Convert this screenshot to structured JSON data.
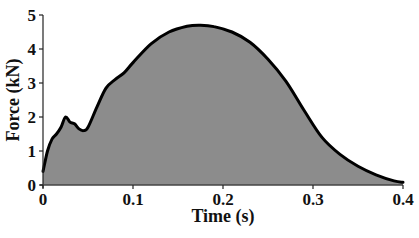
{
  "chart_data": {
    "type": "area",
    "title": "",
    "xlabel": "Time (s)",
    "ylabel": "Force (kN)",
    "xlim": [
      0,
      0.4
    ],
    "ylim": [
      0,
      5
    ],
    "x_ticks": [
      0,
      0.1,
      0.2,
      0.3,
      0.4
    ],
    "x_tick_labels": [
      "0",
      "0.1",
      "0.2",
      "0.3",
      "0.4"
    ],
    "y_ticks": [
      0,
      1,
      2,
      3,
      4,
      5
    ],
    "y_tick_labels": [
      "0",
      "1",
      "2",
      "3",
      "4",
      "5"
    ],
    "grid": false,
    "legend": null,
    "fill_color": "#8c8c8c",
    "line_color": "#000000",
    "series": [
      {
        "name": "Force",
        "x": [
          0,
          0.005,
          0.01,
          0.015,
          0.02,
          0.025,
          0.03,
          0.035,
          0.04,
          0.045,
          0.05,
          0.06,
          0.07,
          0.08,
          0.09,
          0.1,
          0.12,
          0.14,
          0.16,
          0.175,
          0.19,
          0.21,
          0.23,
          0.25,
          0.27,
          0.29,
          0.31,
          0.33,
          0.35,
          0.37,
          0.39,
          0.4
        ],
        "values": [
          0.4,
          1.0,
          1.35,
          1.5,
          1.7,
          2.0,
          1.85,
          1.8,
          1.65,
          1.6,
          1.7,
          2.3,
          2.85,
          3.1,
          3.3,
          3.6,
          4.15,
          4.5,
          4.67,
          4.7,
          4.66,
          4.5,
          4.2,
          3.7,
          3.05,
          2.2,
          1.4,
          0.9,
          0.55,
          0.3,
          0.12,
          0.08
        ]
      }
    ]
  },
  "labels": {
    "xlabel": "Time (s)",
    "ylabel": "Force (kN)"
  }
}
